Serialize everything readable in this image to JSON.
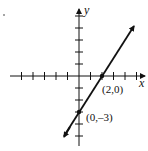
{
  "figure": {
    "type": "line-graph",
    "axes": {
      "x_label": "x",
      "y_label": "y"
    },
    "line": {
      "equation_points": [
        {
          "label": "(2,0)",
          "x": 2,
          "y": 0
        },
        {
          "label": "(0,–3)",
          "x": 0,
          "y": -3
        }
      ],
      "slope": 1.5,
      "y_intercept": -3,
      "x_intercept": 2
    },
    "x_ticks": [
      -5,
      -4,
      -3,
      -2,
      -1,
      1,
      2,
      3,
      4,
      5
    ],
    "y_ticks": [
      -5,
      -4,
      -3,
      -2,
      -1,
      1,
      2,
      3,
      4,
      5
    ],
    "colors": {
      "ink": "#111111",
      "background": "#ffffff"
    }
  }
}
